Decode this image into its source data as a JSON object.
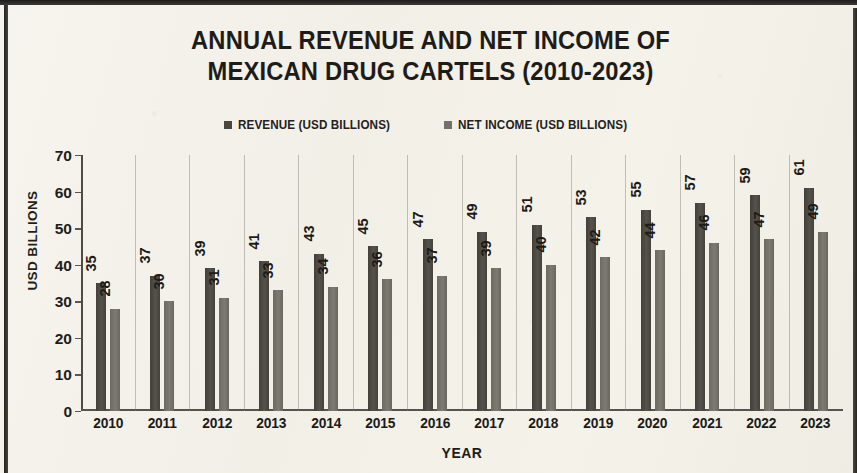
{
  "chart_data": {
    "type": "bar",
    "title": "ANNUAL REVENUE AND NET INCOME OF MEXICAN DRUG CARTELS (2010-2023)",
    "title_lines": [
      "ANNUAL REVENUE AND NET INCOME OF",
      "MEXICAN DRUG CARTELS (2010-2023)"
    ],
    "xlabel": "YEAR",
    "ylabel": "USD BILLIONS",
    "ylim": [
      0,
      70
    ],
    "ytick_step": 10,
    "yticks": [
      70,
      60,
      50,
      40,
      30,
      20,
      10,
      0
    ],
    "grid": false,
    "legend_position": "top-center",
    "categories": [
      "2010",
      "2011",
      "2012",
      "2013",
      "2014",
      "2015",
      "2016",
      "2017",
      "2018",
      "2019",
      "2020",
      "2021",
      "2022",
      "2023"
    ],
    "series": [
      {
        "name": "REVENUE (USD BILLIONS)",
        "color": "#4a4740",
        "values": [
          35,
          37,
          39,
          41,
          43,
          45,
          47,
          49,
          51,
          53,
          55,
          57,
          59,
          61
        ]
      },
      {
        "name": "NET INCOME (USD BILLIONS)",
        "color": "#74716a",
        "values": [
          28,
          30,
          31,
          33,
          34,
          36,
          37,
          39,
          40,
          42,
          44,
          46,
          47,
          49
        ]
      }
    ],
    "data_labels_shown": true,
    "data_label_orientation": "vertical"
  },
  "theme": {
    "background": "#f3f0e9",
    "frame_color": "#2b2a27",
    "text_color": "#1c1b18",
    "axis_color": "#55534e"
  }
}
